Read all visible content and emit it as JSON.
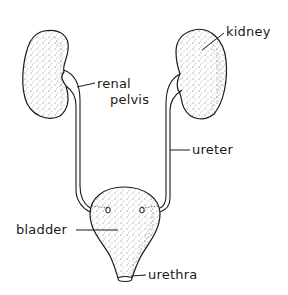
{
  "diagram": {
    "type": "anatomical-illustration",
    "ink_color": "#1a1a1a",
    "background": "#ffffff",
    "labels": {
      "kidney": "kidney",
      "renal_pelvis_line1": "renal",
      "renal_pelvis_line2": "pelvis",
      "ureter": "ureter",
      "bladder": "bladder",
      "urethra": "urethra"
    },
    "structures": [
      {
        "name": "left-kidney"
      },
      {
        "name": "right-kidney"
      },
      {
        "name": "left-ureter"
      },
      {
        "name": "right-ureter"
      },
      {
        "name": "bladder"
      },
      {
        "name": "urethra"
      }
    ]
  }
}
